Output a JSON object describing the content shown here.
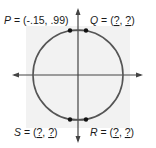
{
  "diagram": {
    "type": "unit-circle",
    "colors": {
      "background_square": "#f2f2f2",
      "circle": "#555555",
      "axes": "#444444",
      "points": "#111111",
      "text": "#1a1a1a"
    },
    "points": [
      {
        "name": "P",
        "x_value": "-.15",
        "y_value": ".99",
        "quadrant": "top-left"
      },
      {
        "name": "Q",
        "x_value": "?",
        "y_value": "?",
        "quadrant": "top-right"
      },
      {
        "name": "S",
        "x_value": "?",
        "y_value": "?",
        "quadrant": "bottom-left"
      },
      {
        "name": "R",
        "x_value": "?",
        "y_value": "?",
        "quadrant": "bottom-right"
      }
    ],
    "labels": {
      "P": {
        "name": "P",
        "eq": " = (",
        "x": "-.15",
        "sep": ", ",
        "y": ".99",
        "close": ")"
      },
      "Q": {
        "name": "Q",
        "eq": " = (",
        "x": "?",
        "sep": ", ",
        "y": "?",
        "close": ")"
      },
      "S": {
        "name": "S",
        "eq": " = (",
        "x": "?",
        "sep": ", ",
        "y": "?",
        "close": ")"
      },
      "R": {
        "name": "R",
        "eq": " = (",
        "x": "?",
        "sep": ", ",
        "y": "?",
        "close": ")"
      }
    }
  }
}
